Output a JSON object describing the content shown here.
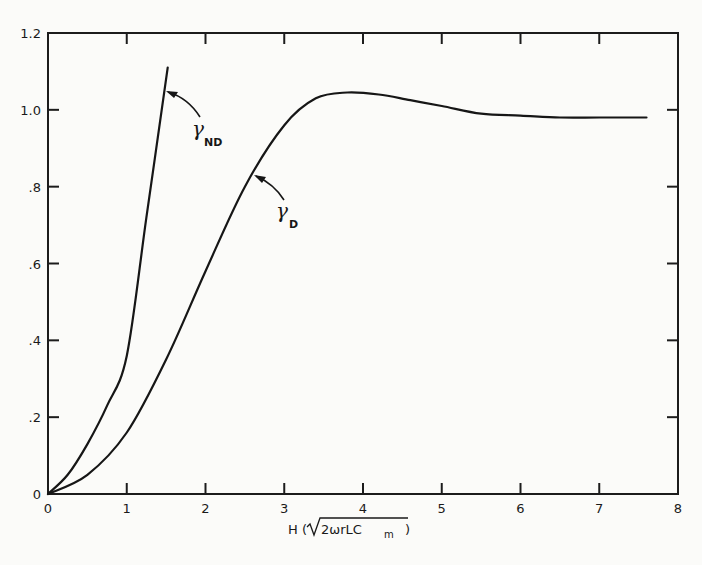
{
  "chart_data": {
    "type": "line",
    "title": "",
    "xlabel": "H (√2ωrLCm)",
    "ylabel": "",
    "xlim": [
      0,
      8
    ],
    "ylim": [
      0,
      1.2
    ],
    "x_ticks": [
      0,
      1,
      2,
      3,
      4,
      5,
      6,
      7,
      8
    ],
    "x_tick_labels": [
      "0",
      "1",
      "2",
      "3",
      "4",
      "5",
      "6",
      "7",
      "8"
    ],
    "y_ticks": [
      0,
      0.2,
      0.4,
      0.6,
      0.8,
      1.0,
      1.2
    ],
    "y_tick_labels": [
      "0",
      ".2",
      ".4",
      ".6",
      ".8",
      "1.0",
      "1.2"
    ],
    "grid": false,
    "legend": "none (curves labeled inline with arrows)",
    "series": [
      {
        "name": "γND",
        "x": [
          0,
          0.25,
          0.5,
          0.75,
          1.0,
          1.25,
          1.52
        ],
        "y": [
          0,
          0.05,
          0.13,
          0.23,
          0.36,
          0.72,
          1.11
        ]
      },
      {
        "name": "γD",
        "x": [
          0,
          0.5,
          1.0,
          1.5,
          2.0,
          2.5,
          3.0,
          3.4,
          3.8,
          4.2,
          4.6,
          5.0,
          5.5,
          6.0,
          6.5,
          7.0,
          7.6
        ],
        "y": [
          0,
          0.05,
          0.16,
          0.35,
          0.58,
          0.8,
          0.96,
          1.03,
          1.045,
          1.04,
          1.025,
          1.01,
          0.99,
          0.985,
          0.98,
          0.98,
          0.98
        ]
      }
    ],
    "annotations": [
      {
        "text": "γND",
        "points_to": "γND",
        "at": [
          1.45,
          1.03
        ]
      },
      {
        "text": "γD",
        "points_to": "γD",
        "at": [
          2.65,
          0.83
        ]
      }
    ]
  },
  "labels": {
    "x_axis_prefix": "H (",
    "x_axis_radicand": "2ωrLC",
    "x_axis_sub": "m",
    "x_axis_suffix": " )",
    "anno_nd_main": "γ",
    "anno_nd_sub": "ND",
    "anno_d_main": "γ",
    "anno_d_sub": "D"
  }
}
